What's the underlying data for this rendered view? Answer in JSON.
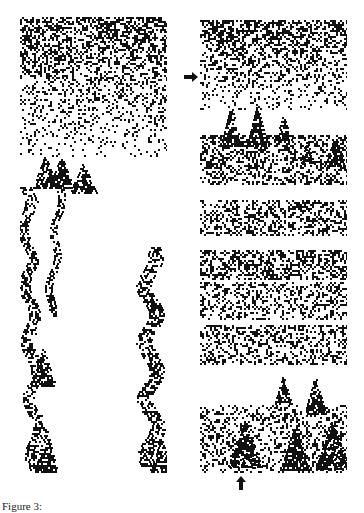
{
  "figure": {
    "caption": "Figure 3:",
    "ink_color": "#111111",
    "background": "#ffffff",
    "panels": [
      {
        "id": "left",
        "description": "Cellular automaton space-time pattern: random initial band decaying into isolated triangular branching structures",
        "noise_band": {
          "top": 0,
          "bottom": 140,
          "density_top": 0.55,
          "density_bottom": 0.05
        },
        "triangles": [
          {
            "x": 12,
            "y": 138,
            "w": 26,
            "h": 34
          },
          {
            "x": 28,
            "y": 138,
            "w": 26,
            "h": 34
          },
          {
            "x": 49,
            "y": 145,
            "w": 28,
            "h": 32
          },
          {
            "x": 10,
            "y": 330,
            "w": 26,
            "h": 40
          },
          {
            "x": 14,
            "y": 410,
            "w": 24,
            "h": 46
          },
          {
            "x": 130,
            "y": 420,
            "w": 22,
            "h": 36
          }
        ],
        "trails": [
          {
            "x0": 6,
            "y0": 170,
            "x1": 16,
            "y1": 456,
            "width": 12
          },
          {
            "x0": 40,
            "y0": 170,
            "x1": 30,
            "y1": 300,
            "width": 8
          },
          {
            "x0": 130,
            "y0": 230,
            "x1": 132,
            "y1": 456,
            "width": 16
          }
        ]
      },
      {
        "id": "right",
        "description": "Cellular automaton space-time pattern with repeated perturbations producing horizontal disordered bands and triangles",
        "noise_band": {
          "top": 0,
          "bottom": 90,
          "density_top": 0.55,
          "density_bottom": 0.1
        },
        "bands": [
          {
            "top": 115,
            "bottom": 165,
            "density": 0.4
          },
          {
            "top": 180,
            "bottom": 215,
            "density": 0.38
          },
          {
            "top": 230,
            "bottom": 260,
            "density": 0.45
          },
          {
            "top": 262,
            "bottom": 300,
            "density": 0.3
          },
          {
            "top": 305,
            "bottom": 345,
            "density": 0.35
          },
          {
            "top": 385,
            "bottom": 453,
            "density": 0.3
          }
        ],
        "triangles": [
          {
            "x": 20,
            "y": 85,
            "w": 22,
            "h": 42
          },
          {
            "x": 46,
            "y": 85,
            "w": 22,
            "h": 42
          },
          {
            "x": 74,
            "y": 95,
            "w": 18,
            "h": 26
          },
          {
            "x": 100,
            "y": 120,
            "w": 14,
            "h": 24
          },
          {
            "x": 124,
            "y": 115,
            "w": 22,
            "h": 32
          },
          {
            "x": 74,
            "y": 355,
            "w": 18,
            "h": 30
          },
          {
            "x": 104,
            "y": 355,
            "w": 22,
            "h": 40
          },
          {
            "x": 28,
            "y": 400,
            "w": 34,
            "h": 48
          },
          {
            "x": 80,
            "y": 405,
            "w": 30,
            "h": 45
          },
          {
            "x": 115,
            "y": 400,
            "w": 34,
            "h": 50
          }
        ]
      }
    ],
    "annotations": [
      {
        "id": "arrow-right",
        "direction": "right",
        "x": 184,
        "y": 73
      },
      {
        "id": "arrow-up",
        "direction": "up",
        "x": 241,
        "y": 482
      }
    ]
  }
}
